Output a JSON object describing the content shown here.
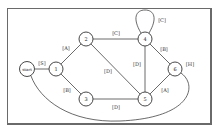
{
  "diagram": {
    "type": "state-transition-graph",
    "nodes": [
      {
        "id": "start",
        "label": "start",
        "x": 27,
        "y": 69
      },
      {
        "id": "1",
        "label": "1",
        "x": 56,
        "y": 69
      },
      {
        "id": "2",
        "label": "2",
        "x": 86,
        "y": 39
      },
      {
        "id": "3",
        "label": "3",
        "x": 86,
        "y": 99
      },
      {
        "id": "4",
        "label": "4",
        "x": 145,
        "y": 39
      },
      {
        "id": "5",
        "label": "5",
        "x": 145,
        "y": 99
      },
      {
        "id": "6",
        "label": "6",
        "x": 175,
        "y": 69
      }
    ],
    "edges": [
      {
        "from": "start",
        "to": "1",
        "label": "[S]"
      },
      {
        "from": "1",
        "to": "2",
        "label": "[A]"
      },
      {
        "from": "1",
        "to": "3",
        "label": "[B]"
      },
      {
        "from": "2",
        "to": "4",
        "label": "[C]"
      },
      {
        "from": "2",
        "to": "5",
        "label": "[D]"
      },
      {
        "from": "3",
        "to": "5",
        "label": "[D]"
      },
      {
        "from": "4",
        "to": "4",
        "label": "[C]"
      },
      {
        "from": "4",
        "to": "5",
        "label": "[D]"
      },
      {
        "from": "4",
        "to": "6",
        "label": "[B]"
      },
      {
        "from": "5",
        "to": "6",
        "label": "[A]"
      },
      {
        "from": "6",
        "to": "start",
        "label": "[H]"
      }
    ]
  }
}
